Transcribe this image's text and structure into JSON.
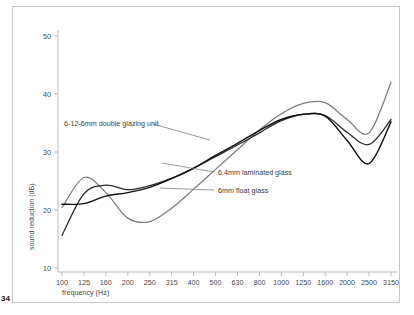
{
  "page": {
    "folio": "34",
    "frame_color": "#c9c9c9",
    "background": "#ffffff"
  },
  "chart_data": {
    "type": "line",
    "title": "",
    "subtitle": "",
    "xlabel": "frequency (Hz)",
    "ylabel": "sound reduction (dB)",
    "xscale": "log-octave-bands",
    "grid": false,
    "legend_position": "inline-annotations",
    "ylim": [
      10,
      50
    ],
    "yticks": [
      10,
      20,
      30,
      40,
      50
    ],
    "ytick_labels": [
      "10",
      "20",
      "30",
      "40",
      "50"
    ],
    "x": [
      100,
      125,
      160,
      200,
      250,
      315,
      400,
      500,
      630,
      800,
      1000,
      1250,
      1600,
      2000,
      2500,
      3150
    ],
    "xtick_labels": [
      "100",
      "125",
      "160",
      "200",
      "250",
      "315",
      "400",
      "500",
      "630",
      "800",
      "1000",
      "1250",
      "1600",
      "2000",
      "2500",
      "3150"
    ],
    "series": [
      {
        "name": "6mm float glass",
        "color": "#7d7d7d",
        "width": 1.25,
        "values": [
          20.4,
          25.6,
          23.0,
          18.6,
          18.0,
          20.3,
          23.6,
          27.0,
          30.4,
          33.8,
          36.6,
          38.4,
          38.5,
          35.6,
          33.3,
          36.4
        ]
      },
      {
        "name": "6.4mm laminated glass",
        "color": "#2b2b2b",
        "width": 1.25,
        "values": [
          15.6,
          22.8,
          24.3,
          23.5,
          24.2,
          25.5,
          27.2,
          29.2,
          31.2,
          33.3,
          35.4,
          36.5,
          36.3,
          33.4,
          31.3,
          33.2
        ]
      },
      {
        "name": "6-12-6mm double glazing unit",
        "color": "#111111",
        "width": 1.45,
        "values": [
          21.0,
          21.1,
          22.4,
          23.0,
          23.9,
          25.4,
          27.2,
          29.4,
          31.5,
          33.7,
          35.6,
          36.5,
          36.2,
          32.0,
          28.0,
          31.0
        ]
      }
    ],
    "series_end_values": {
      "6mm float glass": 42.0,
      "6.4mm laminated glass": 35.6,
      "6-12-6mm double glazing unit": 35.2
    },
    "annotations": [
      {
        "id": "annot-double-glazing",
        "label": "6-12-6mm double glazing unit",
        "text_x": 64,
        "text_y": 126,
        "leader_from_x": 153,
        "leader_from_y": 124,
        "leader_to_x": 210,
        "leader_to_y": 140
      },
      {
        "id": "annot-laminated",
        "label": "6.4mm laminated glass",
        "text_x": 218,
        "text_y": 175,
        "leader_from_x": 214,
        "leader_from_y": 172,
        "leader_to_x": 162,
        "leader_to_y": 163
      },
      {
        "id": "annot-float",
        "label": "6mm float glass",
        "text_x": 218,
        "text_y": 193,
        "leader_from_x": 214,
        "leader_from_y": 190,
        "leader_to_x": 160,
        "leader_to_y": 188
      }
    ]
  }
}
